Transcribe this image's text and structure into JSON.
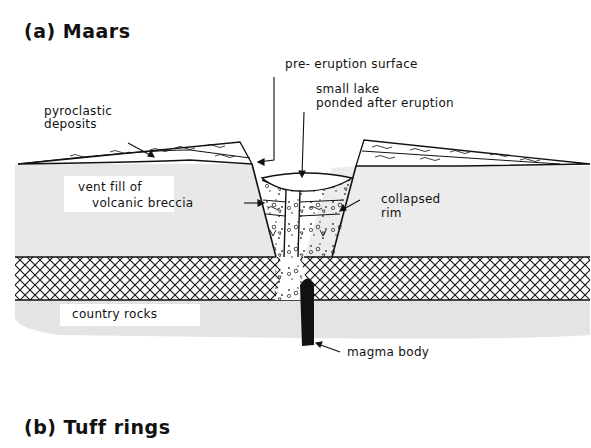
{
  "figure": {
    "panel_a": {
      "title": "(a) Maars",
      "labels": {
        "pre_eruption_surface": "pre- eruption surface",
        "small_lake_line1": "small lake",
        "small_lake_line2": "ponded after eruption",
        "pyroclastic_line1": "pyroclastic",
        "pyroclastic_line2": "deposits",
        "vent_fill_line1": "vent fill of",
        "vent_fill_line2": "volcanic breccia",
        "collapsed_line1": "collapsed",
        "collapsed_line2": "rim",
        "country_rocks": "country rocks",
        "magma_body": "magma body"
      }
    },
    "panel_b": {
      "title": "(b) Tuff rings"
    }
  },
  "colors": {
    "ink": "#111111",
    "country_rock_fill": "#e6e6e6",
    "background": "#ffffff"
  }
}
